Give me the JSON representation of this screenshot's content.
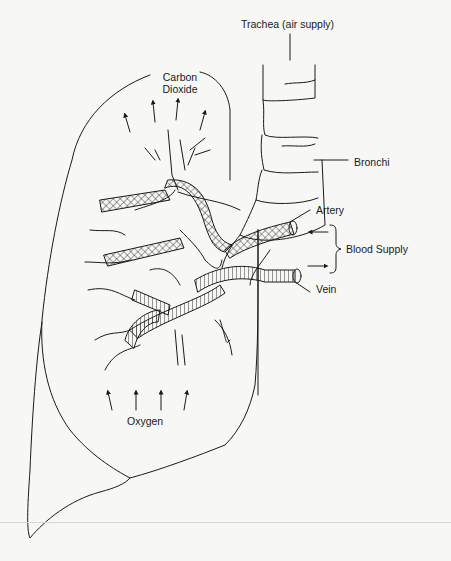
{
  "diagram": {
    "labels": {
      "trachea": "Trachea (air supply)",
      "carbon_dioxide_line1": "Carbon",
      "carbon_dioxide_line2": "Dioxide",
      "bronchi": "Bronchi",
      "artery": "Artery",
      "blood_supply": "Blood Supply",
      "vein": "Vein",
      "oxygen": "Oxygen"
    },
    "arrows": {
      "carbon_dioxide": {
        "count": 4,
        "direction": "up"
      },
      "oxygen": {
        "count": 4,
        "direction": "up"
      },
      "artery_inflow": {
        "direction": "left"
      },
      "vein_outflow": {
        "direction": "right"
      }
    },
    "colors": {
      "background": "#f7f7f5",
      "line": "#1a1a1a"
    }
  }
}
